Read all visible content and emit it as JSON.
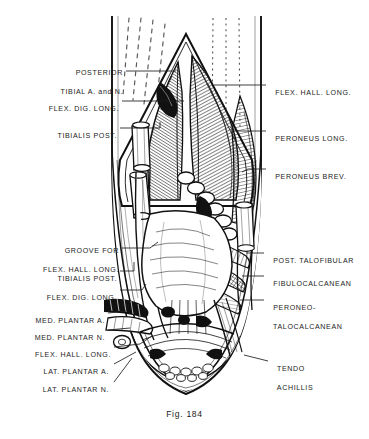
{
  "plate": {
    "header": "THE ANATOMY OF THE ANKLE",
    "caption": "Fig. 184",
    "background_color": "#ffffff",
    "ink_color": "#1a1a1a",
    "view": "posterior dissection of the right ankle and heel"
  },
  "labels_left": [
    {
      "id": "posterior-tibial-a-n",
      "lines": [
        "POSTERIOR",
        "TIBIAL A. and N."
      ]
    },
    {
      "id": "flex-dig-long-upper",
      "lines": [
        "FLEX. DIG. LONG."
      ]
    },
    {
      "id": "tibialis-post-upper",
      "lines": [
        "TIBIALIS POST."
      ]
    },
    {
      "id": "groove-for-flex-hall-long",
      "lines": [
        "GROOVE FOR",
        "FLEX. HALL. LONG."
      ]
    },
    {
      "id": "tibialis-post-lower",
      "lines": [
        "TIBIALIS POST."
      ]
    },
    {
      "id": "flex-dig-long-lower",
      "lines": [
        "FLEX. DIG. LONG."
      ]
    },
    {
      "id": "med-plantar-a",
      "lines": [
        "MED. PLANTAR A."
      ]
    },
    {
      "id": "med-plantar-n",
      "lines": [
        "MED. PLANTAR N."
      ]
    },
    {
      "id": "flex-hall-long-lower",
      "lines": [
        "FLEX. HALL. LONG."
      ]
    },
    {
      "id": "lat-plantar-a",
      "lines": [
        "LAT. PLANTAR A."
      ]
    },
    {
      "id": "lat-plantar-n",
      "lines": [
        "LAT. PLANTAR N."
      ]
    }
  ],
  "labels_right": [
    {
      "id": "flex-hall-long-upper",
      "lines": [
        "FLEX. HALL. LONG."
      ]
    },
    {
      "id": "peroneus-long",
      "lines": [
        "PERONEUS LONG."
      ]
    },
    {
      "id": "peroneus-brev",
      "lines": [
        "PERONEUS BREV."
      ]
    },
    {
      "id": "post-talofibular",
      "lines": [
        "POST. TALOFIBULAR"
      ]
    },
    {
      "id": "fibulocalcanean",
      "lines": [
        "FIBULOCALCANEAN"
      ]
    },
    {
      "id": "peroneo-talocalcanean",
      "lines": [
        "PERONEO-",
        "TALOCALCANEAN"
      ]
    },
    {
      "id": "tendo-achillis",
      "lines": [
        "TENDO",
        "ACHILLIS"
      ]
    }
  ]
}
